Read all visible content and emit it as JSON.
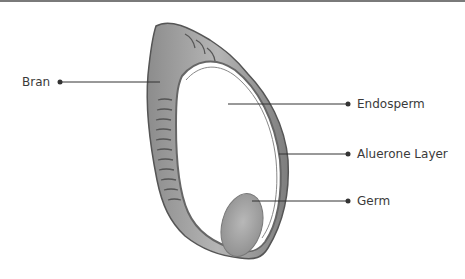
{
  "diagram": {
    "labels": [
      {
        "id": "bran",
        "text": "Bran",
        "side": "left"
      },
      {
        "id": "endosperm",
        "text": "Endosperm",
        "side": "right"
      },
      {
        "id": "aleurone",
        "text": "Aluerone Layer",
        "side": "right"
      },
      {
        "id": "germ",
        "text": "Germ",
        "side": "right"
      }
    ],
    "colors": {
      "line": "#333333",
      "text": "#3a3a3a",
      "bran_fill": "#9a9a9a",
      "germ_fill": "#a8a8a8",
      "outline": "#555555"
    }
  }
}
